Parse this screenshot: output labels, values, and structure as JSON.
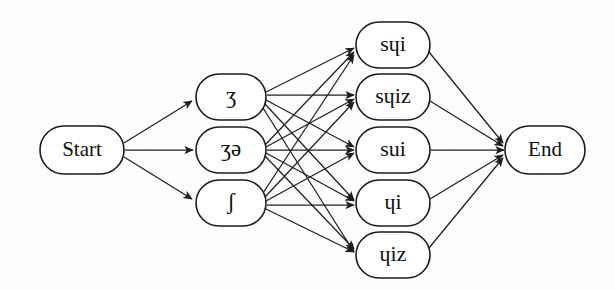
{
  "figure": {
    "kind": "pronunciation-lattice",
    "orientation": "left-to-right",
    "background_color": "#fdfdfc",
    "stroke_color": "#1f1f1f",
    "node_fill": "#ffffff"
  },
  "nodes": {
    "start": {
      "id": "start",
      "label": "Start",
      "cx": 82,
      "cy": 150,
      "rx": 42,
      "ry": 24
    },
    "end": {
      "id": "end",
      "label": "End",
      "cx": 545,
      "cy": 150,
      "rx": 40,
      "ry": 24
    },
    "middle": [
      {
        "id": "m1",
        "label": "ʒ",
        "cx": 231,
        "cy": 97,
        "rx": 35,
        "ry": 23
      },
      {
        "id": "m2",
        "label": "ʒə",
        "cx": 231,
        "cy": 150,
        "rx": 35,
        "ry": 23
      },
      {
        "id": "m3",
        "label": "ʃ",
        "cx": 231,
        "cy": 203,
        "rx": 35,
        "ry": 23
      }
    ],
    "right": [
      {
        "id": "r1",
        "label": "sɥi",
        "cx": 393,
        "cy": 45,
        "rx": 37,
        "ry": 23
      },
      {
        "id": "r2",
        "label": "sɥiz",
        "cx": 393,
        "cy": 97,
        "rx": 37,
        "ry": 23
      },
      {
        "id": "r3",
        "label": "sui",
        "cx": 393,
        "cy": 150,
        "rx": 37,
        "ry": 23
      },
      {
        "id": "r4",
        "label": "ɥi",
        "cx": 393,
        "cy": 203,
        "rx": 37,
        "ry": 23
      },
      {
        "id": "r5",
        "label": "ɥiz",
        "cx": 393,
        "cy": 255,
        "rx": 37,
        "ry": 23
      }
    ]
  },
  "edges": {
    "start_to_middle": [
      {
        "from": "start",
        "to": "m1"
      },
      {
        "from": "start",
        "to": "m2"
      },
      {
        "from": "start",
        "to": "m3"
      }
    ],
    "middle_to_right": [
      {
        "from": "m1",
        "to": "r1"
      },
      {
        "from": "m1",
        "to": "r2"
      },
      {
        "from": "m1",
        "to": "r3"
      },
      {
        "from": "m1",
        "to": "r4"
      },
      {
        "from": "m1",
        "to": "r5"
      },
      {
        "from": "m2",
        "to": "r1"
      },
      {
        "from": "m2",
        "to": "r2"
      },
      {
        "from": "m2",
        "to": "r3"
      },
      {
        "from": "m2",
        "to": "r4"
      },
      {
        "from": "m2",
        "to": "r5"
      },
      {
        "from": "m3",
        "to": "r1"
      },
      {
        "from": "m3",
        "to": "r2"
      },
      {
        "from": "m3",
        "to": "r3"
      },
      {
        "from": "m3",
        "to": "r4"
      },
      {
        "from": "m3",
        "to": "r5"
      }
    ],
    "right_to_end": [
      {
        "from": "r1",
        "to": "end"
      },
      {
        "from": "r2",
        "to": "end"
      },
      {
        "from": "r3",
        "to": "end"
      },
      {
        "from": "r4",
        "to": "end"
      },
      {
        "from": "r5",
        "to": "end"
      }
    ]
  },
  "labels": {
    "start": "Start",
    "end": "End",
    "m1": "ʒ",
    "m2": "ʒə",
    "m3": "ʃ",
    "r1": "sɥi",
    "r2": "sɥiz",
    "r3": "sui",
    "r4": "ɥi",
    "r5": "ɥiz"
  }
}
